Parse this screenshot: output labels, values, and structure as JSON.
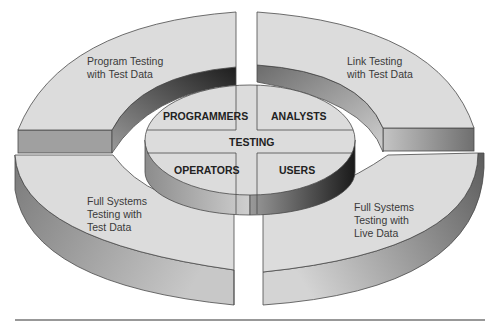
{
  "diagram": {
    "center": {
      "label": "TESTING"
    },
    "roles": [
      {
        "id": "programmers",
        "label": "PROGRAMMERS"
      },
      {
        "id": "analysts",
        "label": "ANALYSTS"
      },
      {
        "id": "operators",
        "label": "OPERATORS"
      },
      {
        "id": "users",
        "label": "USERS"
      }
    ],
    "quadrants": [
      {
        "id": "program-testing",
        "lines": [
          "Program Testing",
          "with Test Data"
        ]
      },
      {
        "id": "link-testing",
        "lines": [
          "Link Testing",
          "with Test Data"
        ]
      },
      {
        "id": "full-systems-test-data",
        "lines": [
          "Full Systems",
          "Testing with",
          "Test Data"
        ]
      },
      {
        "id": "full-systems-live-data",
        "lines": [
          "Full Systems",
          "Testing with",
          "Live Data"
        ]
      }
    ],
    "colors": {
      "top_surface": "#dcdcdc",
      "side_dark": "#8a8a8a",
      "side_mid": "#b0b0b0",
      "outline": "#4a4a4a",
      "rule": "#333333"
    }
  }
}
